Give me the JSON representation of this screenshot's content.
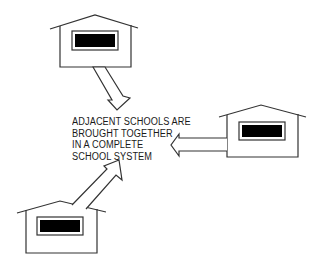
{
  "diagram": {
    "caption_lines": [
      "ADJACENT SCHOOLS ARE",
      "BROUGHT TOGETHER",
      "IN A COMPLETE",
      "SCHOOL SYSTEM"
    ],
    "nodes": [
      {
        "id": "school-top",
        "label": "school building",
        "position": "top-left"
      },
      {
        "id": "school-right",
        "label": "school building",
        "position": "right"
      },
      {
        "id": "school-bottom",
        "label": "school building",
        "position": "bottom-left"
      }
    ],
    "edges": [
      {
        "from": "school-top",
        "to": "caption",
        "direction": "down-right"
      },
      {
        "from": "school-right",
        "to": "caption",
        "direction": "left"
      },
      {
        "from": "school-bottom",
        "to": "caption",
        "direction": "up-right"
      }
    ],
    "colors": {
      "stroke": "#333333",
      "window_fill": "#000000",
      "background": "#ffffff"
    }
  }
}
